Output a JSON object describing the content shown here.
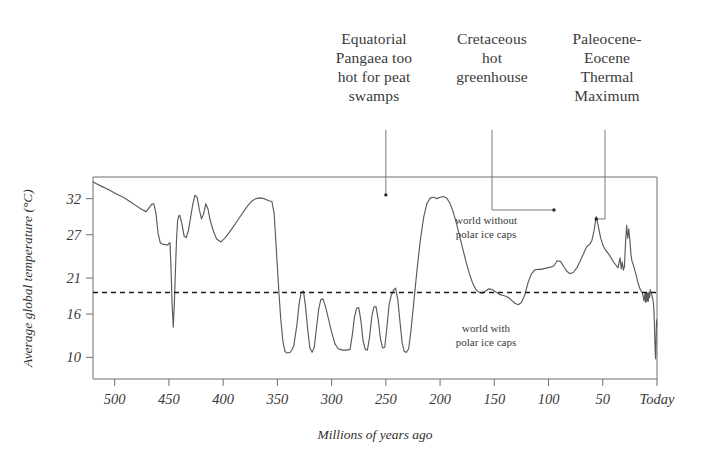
{
  "chart_data": {
    "type": "line",
    "title": "",
    "xlabel": "Millions of years ago",
    "ylabel": "Average global temperature (°C)",
    "xlim": [
      520,
      0
    ],
    "ylim": [
      7,
      35
    ],
    "x_ticks": [
      500,
      450,
      400,
      350,
      300,
      250,
      200,
      150,
      100,
      50,
      0
    ],
    "x_tick_labels": [
      "500",
      "450",
      "400",
      "350",
      "300",
      "250",
      "200",
      "150",
      "100",
      "50",
      "Today"
    ],
    "y_ticks": [
      32,
      27,
      21,
      16,
      10
    ],
    "y_tick_labels": [
      "32",
      "27",
      "21",
      "16",
      "10"
    ],
    "grid": false,
    "legend_position": "none",
    "reference_line": {
      "value": 19,
      "style": "dashed",
      "color": "#1a1a1a",
      "above_label": "world without polar ice caps",
      "below_label": "world with polar ice caps"
    },
    "series": [
      {
        "name": "Average global temperature",
        "color": "#5a5a5a",
        "points": [
          [
            520,
            34.3
          ],
          [
            512,
            33.7
          ],
          [
            505,
            33.2
          ],
          [
            498,
            32.6
          ],
          [
            492,
            32.2
          ],
          [
            486,
            31.6
          ],
          [
            480,
            31.0
          ],
          [
            475,
            30.5
          ],
          [
            471,
            30.2
          ],
          [
            468,
            30.8
          ],
          [
            466,
            31.2
          ],
          [
            464,
            31.3
          ],
          [
            462,
            30.0
          ],
          [
            460,
            27.2
          ],
          [
            458,
            25.9
          ],
          [
            456,
            25.7
          ],
          [
            453,
            25.6
          ],
          [
            451,
            25.6
          ],
          [
            450,
            25.8
          ],
          [
            449,
            25.9
          ],
          [
            448,
            22.0
          ],
          [
            447,
            17.2
          ],
          [
            446,
            14.2
          ],
          [
            445,
            17.5
          ],
          [
            444,
            22.0
          ],
          [
            443,
            26.3
          ],
          [
            442,
            28.9
          ],
          [
            441,
            29.6
          ],
          [
            440,
            29.7
          ],
          [
            438,
            28.5
          ],
          [
            436,
            26.8
          ],
          [
            434,
            26.6
          ],
          [
            432,
            27.6
          ],
          [
            430,
            29.4
          ],
          [
            428,
            31.2
          ],
          [
            426,
            32.5
          ],
          [
            424,
            32.2
          ],
          [
            422,
            30.5
          ],
          [
            420,
            29.2
          ],
          [
            418,
            29.9
          ],
          [
            416,
            31.3
          ],
          [
            414,
            30.6
          ],
          [
            412,
            29.0
          ],
          [
            409,
            27.5
          ],
          [
            406,
            26.4
          ],
          [
            402,
            26.0
          ],
          [
            398,
            26.6
          ],
          [
            393,
            27.6
          ],
          [
            388,
            28.7
          ],
          [
            383,
            29.8
          ],
          [
            378,
            30.9
          ],
          [
            374,
            31.6
          ],
          [
            370,
            32.0
          ],
          [
            366,
            32.1
          ],
          [
            362,
            32.0
          ],
          [
            358,
            31.7
          ],
          [
            355,
            31.6
          ],
          [
            353,
            30.0
          ],
          [
            351,
            25.0
          ],
          [
            349,
            20.0
          ],
          [
            347,
            15.5
          ],
          [
            345,
            12.3
          ],
          [
            343,
            10.8
          ],
          [
            341,
            10.6
          ],
          [
            338,
            10.7
          ],
          [
            335,
            11.5
          ],
          [
            332,
            14.5
          ],
          [
            330,
            17.4
          ],
          [
            328,
            19.0
          ],
          [
            326,
            19.2
          ],
          [
            324,
            17.0
          ],
          [
            322,
            13.8
          ],
          [
            320,
            11.3
          ],
          [
            318,
            10.7
          ],
          [
            316,
            11.4
          ],
          [
            314,
            14.0
          ],
          [
            312,
            16.6
          ],
          [
            310,
            18.0
          ],
          [
            308,
            18.1
          ],
          [
            306,
            17.2
          ],
          [
            303,
            15.4
          ],
          [
            300,
            13.5
          ],
          [
            297,
            11.9
          ],
          [
            294,
            11.2
          ],
          [
            290,
            11.0
          ],
          [
            286,
            11.0
          ],
          [
            283,
            11.1
          ],
          [
            281,
            13.0
          ],
          [
            279,
            15.5
          ],
          [
            277,
            16.8
          ],
          [
            275,
            16.9
          ],
          [
            273,
            15.1
          ],
          [
            271,
            12.3
          ],
          [
            269,
            11.1
          ],
          [
            267,
            11.0
          ],
          [
            265,
            12.8
          ],
          [
            263,
            15.6
          ],
          [
            261,
            17.0
          ],
          [
            259,
            17.0
          ],
          [
            257,
            15.2
          ],
          [
            255,
            12.6
          ],
          [
            253,
            11.3
          ],
          [
            251,
            11.4
          ],
          [
            249,
            14.2
          ],
          [
            247,
            17.3
          ],
          [
            245,
            18.6
          ],
          [
            243,
            19.3
          ],
          [
            241,
            19.6
          ],
          [
            239,
            18.0
          ],
          [
            237,
            15.0
          ],
          [
            235,
            12.0
          ],
          [
            233,
            10.8
          ],
          [
            231,
            10.7
          ],
          [
            229,
            11.2
          ],
          [
            227,
            13.5
          ],
          [
            224,
            18.0
          ],
          [
            221,
            22.5
          ],
          [
            218,
            26.5
          ],
          [
            215,
            29.5
          ],
          [
            212,
            31.4
          ],
          [
            209,
            32.1
          ],
          [
            206,
            32.2
          ],
          [
            203,
            32.0
          ],
          [
            200,
            32.2
          ],
          [
            197,
            32.3
          ],
          [
            194,
            32.1
          ],
          [
            191,
            31.4
          ],
          [
            188,
            30.2
          ],
          [
            185,
            28.6
          ],
          [
            182,
            26.8
          ],
          [
            179,
            25.0
          ],
          [
            176,
            23.2
          ],
          [
            173,
            21.6
          ],
          [
            170,
            20.3
          ],
          [
            167,
            19.4
          ],
          [
            164,
            19.0
          ],
          [
            161,
            18.9
          ],
          [
            158,
            19.2
          ],
          [
            155,
            19.5
          ],
          [
            152,
            19.4
          ],
          [
            149,
            19.1
          ],
          [
            146,
            18.8
          ],
          [
            143,
            18.6
          ],
          [
            140,
            18.5
          ],
          [
            137,
            18.3
          ],
          [
            134,
            17.9
          ],
          [
            131,
            17.5
          ],
          [
            128,
            17.3
          ],
          [
            125,
            17.6
          ],
          [
            122,
            18.6
          ],
          [
            119,
            20.3
          ],
          [
            116,
            21.5
          ],
          [
            113,
            22.1
          ],
          [
            110,
            22.2
          ],
          [
            107,
            22.2
          ],
          [
            104,
            22.3
          ],
          [
            101,
            22.4
          ],
          [
            98,
            22.5
          ],
          [
            95,
            22.7
          ],
          [
            92,
            23.4
          ],
          [
            89,
            23.3
          ],
          [
            86,
            22.6
          ],
          [
            83,
            21.9
          ],
          [
            80,
            21.6
          ],
          [
            77,
            21.8
          ],
          [
            74,
            22.4
          ],
          [
            71,
            23.3
          ],
          [
            68,
            24.3
          ],
          [
            65,
            25.3
          ],
          [
            62,
            25.7
          ],
          [
            60,
            26.2
          ],
          [
            58,
            27.6
          ],
          [
            56,
            29.5
          ],
          [
            54,
            28.1
          ],
          [
            52,
            26.6
          ],
          [
            50,
            25.6
          ],
          [
            48,
            25.0
          ],
          [
            46,
            24.6
          ],
          [
            44,
            24.2
          ],
          [
            42,
            23.7
          ],
          [
            40,
            23.2
          ],
          [
            38,
            22.8
          ],
          [
            36,
            22.4
          ],
          [
            34,
            23.8
          ],
          [
            33,
            22.3
          ],
          [
            32,
            23.2
          ],
          [
            31,
            22.1
          ],
          [
            30,
            22.6
          ],
          [
            29,
            26.0
          ],
          [
            28,
            28.3
          ],
          [
            27,
            26.5
          ],
          [
            26,
            27.8
          ],
          [
            25,
            26.2
          ],
          [
            24,
            24.2
          ],
          [
            23,
            23.3
          ],
          [
            22,
            22.9
          ],
          [
            21,
            22.4
          ],
          [
            20,
            21.8
          ],
          [
            19,
            21.3
          ],
          [
            18,
            20.6
          ],
          [
            17,
            20.1
          ],
          [
            16,
            19.6
          ],
          [
            15,
            19.3
          ],
          [
            14,
            19.1
          ],
          [
            13,
            18.7
          ],
          [
            12,
            17.8
          ],
          [
            11,
            18.9
          ],
          [
            10.4,
            17.6
          ],
          [
            9.8,
            19.0
          ],
          [
            9.2,
            17.8
          ],
          [
            8.6,
            18.9
          ],
          [
            8.0,
            17.8
          ],
          [
            7.4,
            19.0
          ],
          [
            6.8,
            18.3
          ],
          [
            6.2,
            19.4
          ],
          [
            5.6,
            19.0
          ],
          [
            5.0,
            18.7
          ],
          [
            4.4,
            18.4
          ],
          [
            3.8,
            18.0
          ],
          [
            3.2,
            17.4
          ],
          [
            2.8,
            16.4
          ],
          [
            2.4,
            14.6
          ],
          [
            2.0,
            12.4
          ],
          [
            1.6,
            10.6
          ],
          [
            1.3,
            9.8
          ],
          [
            1.0,
            11.5
          ],
          [
            0.7,
            13.6
          ],
          [
            0.4,
            15.2
          ],
          [
            0.1,
            14.4
          ]
        ]
      }
    ],
    "annotations": [
      {
        "id": "equatorial-pangaea",
        "text": "Equatorial Pangaea too hot for peat swamps",
        "lines": [
          "Equatorial",
          "Pangaea too",
          "hot for peat",
          "swamps"
        ],
        "target_x": 250,
        "target_y": 32.1
      },
      {
        "id": "cretaceous-greenhouse",
        "text": "Cretaceous hot greenhouse",
        "lines": [
          "Cretaceous",
          "hot",
          "greenhouse"
        ],
        "target_x": 95,
        "target_y": 29.5
      },
      {
        "id": "petm",
        "text": "Paleocene-Eocene Thermal Maximum",
        "lines": [
          "Paleocene-",
          "Eocene",
          "Thermal",
          "Maximum"
        ],
        "target_x": 56,
        "target_y": 28.0
      }
    ]
  },
  "axes": {
    "y_title": "Average global temperature (°C)",
    "x_title": "Millions of years ago",
    "y_labels": [
      "32",
      "27",
      "21",
      "16",
      "10"
    ],
    "x_labels": [
      "500",
      "450",
      "400",
      "350",
      "300",
      "250",
      "200",
      "150",
      "100",
      "50",
      "Today"
    ]
  },
  "callouts": [
    {
      "line1": "Equatorial",
      "line2": "Pangaea too",
      "line3": "hot for peat",
      "line4": "swamps"
    },
    {
      "line1": "Cretaceous",
      "line2": "hot",
      "line3": "greenhouse",
      "line4": ""
    },
    {
      "line1": "Paleocene-",
      "line2": "Eocene",
      "line3": "Thermal",
      "line4": "Maximum"
    }
  ],
  "inner_notes": {
    "without_line1": "world without",
    "without_line2": "polar ice caps",
    "with_line1": "world with",
    "with_line2": "polar ice caps"
  },
  "colors": {
    "background": "#ffffff",
    "series": "#5a5a5a",
    "frame": "#6f6f6f",
    "reference": "#1a1a1a",
    "text": "#3a3a3a",
    "leader": "#7a7a7a"
  }
}
